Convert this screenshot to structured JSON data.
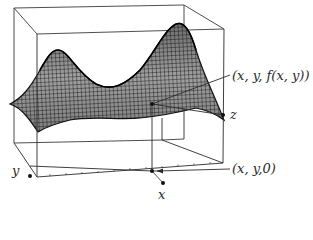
{
  "figure": {
    "type": "3D surface plot with bounding box",
    "labels": {
      "point_on_surface": "(x, y, f(x, y))",
      "point_on_plane": "(x, y,0)",
      "x_axis": "x",
      "y_axis": "y",
      "z_axis": "z"
    },
    "colors": {
      "line": "#2a2a2a",
      "mesh": "#1a1a1a",
      "surface_fill": "#9a9a9a",
      "background": "#ffffff"
    }
  }
}
